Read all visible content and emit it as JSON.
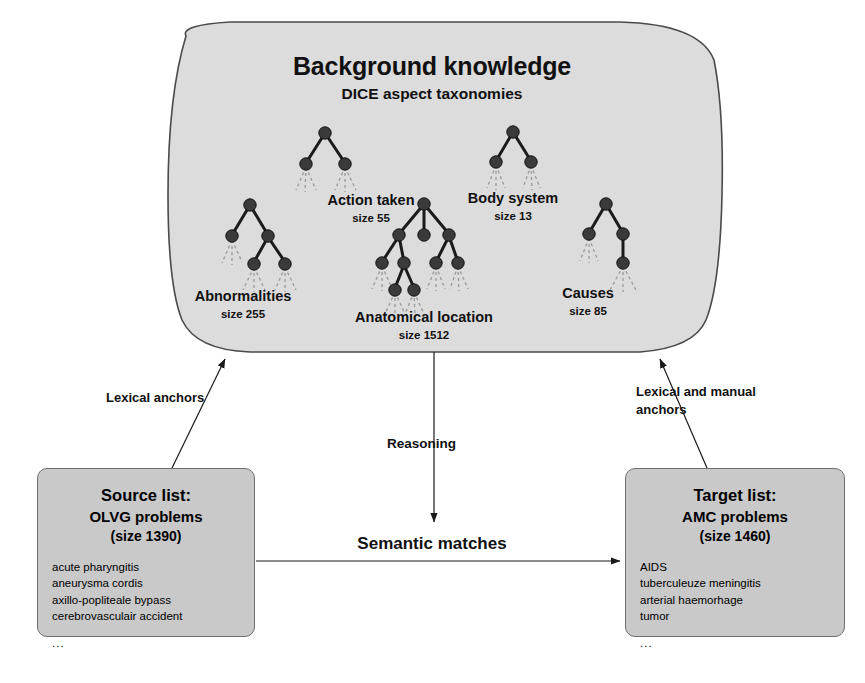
{
  "diagram": {
    "background_panel": {
      "title": "Background knowledge",
      "subtitle": "DICE aspect taxonomies",
      "taxonomies": [
        {
          "name": "Action taken",
          "size_label": "size 55"
        },
        {
          "name": "Body system",
          "size_label": "size 13"
        },
        {
          "name": "Abnormalities",
          "size_label": "size 255"
        },
        {
          "name": "Anatomical location",
          "size_label": "size 1512"
        },
        {
          "name": "Causes",
          "size_label": "size 85"
        }
      ]
    },
    "source_box": {
      "title": "Source list:",
      "subtitle": "OLVG problems",
      "size_label": "(size 1390)",
      "items": [
        "acute pharyngitis",
        "aneurysma cordis",
        "axillo-popliteale bypass",
        "cerebrovasculair accident"
      ],
      "ellipsis": "..."
    },
    "target_box": {
      "title": "Target list:",
      "subtitle": "AMC problems",
      "size_label": "(size 1460)",
      "items": [
        "AIDS",
        "tuberculeuze meningitis",
        "arterial haemorhage",
        "tumor"
      ],
      "ellipsis": "..."
    },
    "edges": {
      "left_anchor_label": "Lexical anchors",
      "right_anchor_label_line1": "Lexical and manual",
      "right_anchor_label_line2": "anchors",
      "reasoning_label": "Reasoning",
      "matches_label": "Semantic matches"
    },
    "colors": {
      "panel_fill": "#dcdcdc",
      "panel_stroke": "#4a4a4a",
      "box_fill": "#c9c9c9",
      "box_stroke": "#6f6f6f",
      "node_fill": "#3a3a3a",
      "edge_stroke": "#1a1a1a",
      "dashed_stroke": "#8a8a8a",
      "text": "#111111"
    }
  }
}
